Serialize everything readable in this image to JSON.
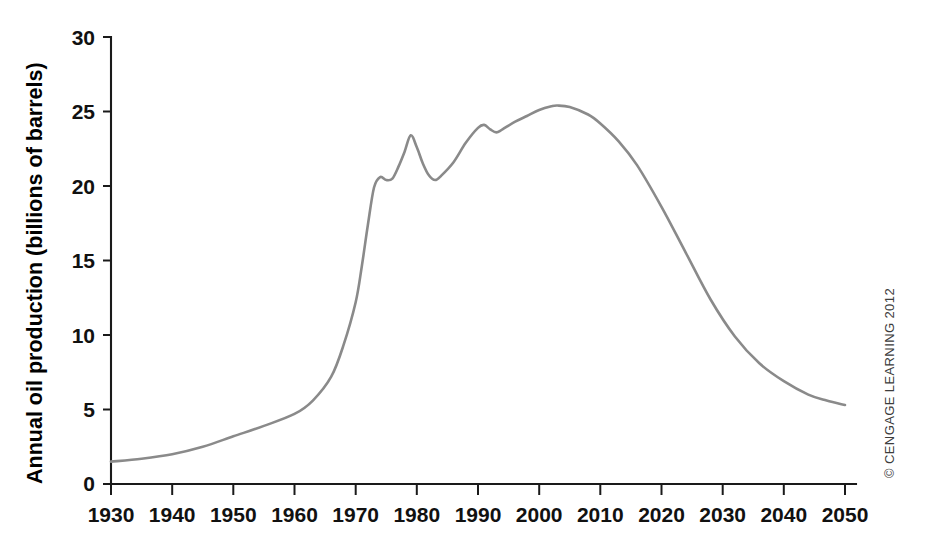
{
  "chart_data": {
    "type": "line",
    "title": "",
    "xlabel": "",
    "ylabel": "Annual oil production (billions of barrels)",
    "xlim": [
      1930,
      2050
    ],
    "ylim": [
      0,
      30
    ],
    "grid": false,
    "legend": null,
    "x_ticks": [
      "1930",
      "1940",
      "1950",
      "1960",
      "1970",
      "1980",
      "1990",
      "2000",
      "2010",
      "2020",
      "2030",
      "2040",
      "2050"
    ],
    "y_ticks": [
      "0",
      "5",
      "10",
      "15",
      "20",
      "25",
      "30"
    ],
    "series": [
      {
        "name": "Annual oil production",
        "color": "#8a8a8a",
        "x": [
          1930,
          1935,
          1940,
          1945,
          1950,
          1955,
          1960,
          1963,
          1966,
          1968,
          1970,
          1971,
          1972,
          1973,
          1974,
          1975,
          1976,
          1977,
          1978,
          1979,
          1980,
          1981,
          1982,
          1983,
          1984,
          1986,
          1988,
          1990,
          1991,
          1992,
          1993,
          1994,
          1996,
          1998,
          2000,
          2002,
          2003,
          2005,
          2008,
          2010,
          2013,
          2016,
          2020,
          2024,
          2028,
          2032,
          2036,
          2040,
          2044,
          2047,
          2050
        ],
        "y": [
          1.5,
          1.7,
          2.0,
          2.5,
          3.2,
          3.9,
          4.7,
          5.6,
          7.2,
          9.3,
          12.2,
          14.6,
          17.4,
          19.9,
          20.6,
          20.4,
          20.5,
          21.3,
          22.3,
          23.4,
          22.6,
          21.5,
          20.7,
          20.4,
          20.7,
          21.6,
          22.9,
          23.9,
          24.1,
          23.8,
          23.6,
          23.8,
          24.3,
          24.7,
          25.1,
          25.35,
          25.4,
          25.3,
          24.8,
          24.2,
          23.0,
          21.4,
          18.6,
          15.5,
          12.4,
          9.9,
          8.1,
          6.9,
          6.0,
          5.6,
          5.3
        ]
      }
    ]
  },
  "annotations": {
    "credit": "© CENGAGE LEARNING 2012"
  }
}
